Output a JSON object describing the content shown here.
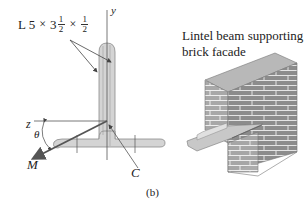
{
  "section_designation": {
    "prefix": "L 5",
    "times": "×",
    "whole": "3",
    "frac1": {
      "num": "1",
      "den": "2"
    },
    "frac2": {
      "num": "1",
      "den": "2"
    }
  },
  "axes": {
    "y": "y",
    "z": "z"
  },
  "angle_label": "θ",
  "moment_label": "M",
  "centroid_label": "C",
  "figure_caption": "(b)",
  "photo": {
    "title_line1": "Lintel beam supporting",
    "title_line2": "brick facade"
  },
  "colors": {
    "steel_fill": "#d4d4d4",
    "steel_edge": "#8a8a8a",
    "brick": "#8c8c8c",
    "mortar": "#e8e8e8",
    "line": "#444444"
  }
}
